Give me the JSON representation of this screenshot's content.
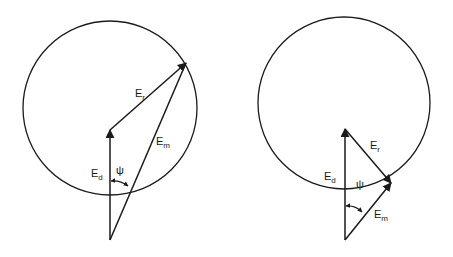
{
  "diagrams": [
    {
      "id": "left",
      "labels": {
        "Er": {
          "main": "E",
          "sub": "r"
        },
        "Em": {
          "main": "E",
          "sub": "m"
        },
        "Ed": {
          "main": "E",
          "sub": "d"
        },
        "psi": "ψ"
      }
    },
    {
      "id": "right",
      "labels": {
        "Er": {
          "main": "E",
          "sub": "r"
        },
        "Em": {
          "main": "E",
          "sub": "m"
        },
        "Ed": {
          "main": "E",
          "sub": "d"
        },
        "psi": "ψ"
      }
    }
  ],
  "colors": {
    "stroke": "#1a1a1a",
    "background": "#ffffff"
  }
}
